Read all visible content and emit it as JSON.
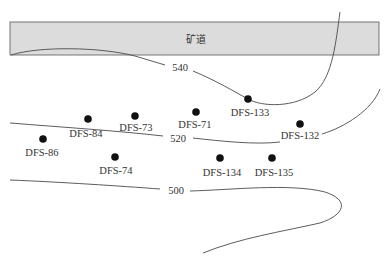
{
  "diagram": {
    "tunnel": {
      "label": "矿道",
      "fill": "#dcdcdc",
      "stroke": "#555555"
    },
    "contours": [
      {
        "value": "540",
        "label": "540"
      },
      {
        "value": "520",
        "label": "520"
      },
      {
        "value": "500",
        "label": "500"
      }
    ],
    "wells": [
      {
        "id": "DFS-86",
        "label": "DFS-86"
      },
      {
        "id": "DFS-84",
        "label": "DFS-84"
      },
      {
        "id": "DFS-73",
        "label": "DFS-73"
      },
      {
        "id": "DFS-71",
        "label": "DFS-71"
      },
      {
        "id": "DFS-133",
        "label": "DFS-133"
      },
      {
        "id": "DFS-132",
        "label": "DFS-132"
      },
      {
        "id": "DFS-74",
        "label": "DFS-74"
      },
      {
        "id": "DFS-134",
        "label": "DFS-134"
      },
      {
        "id": "DFS-135",
        "label": "DFS-135"
      }
    ]
  }
}
